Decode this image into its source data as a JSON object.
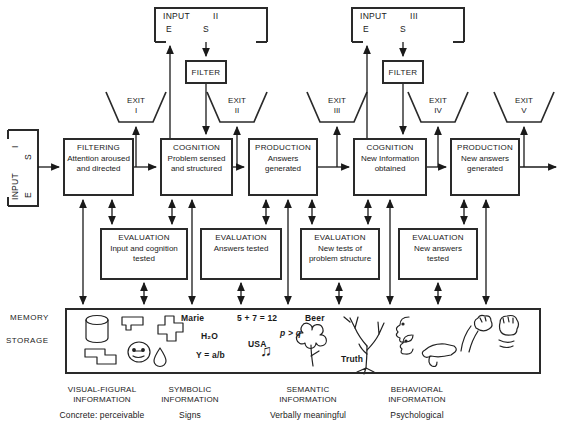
{
  "inputs": {
    "side": {
      "label": "INPUT",
      "numeral": "I",
      "letter_s": "S",
      "letter_e": "E"
    },
    "top_left": {
      "label": "INPUT",
      "numeral": "II",
      "letter_e": "E",
      "letter_s": "S"
    },
    "top_right": {
      "label": "INPUT",
      "numeral": "III",
      "letter_e": "E",
      "letter_s": "S"
    }
  },
  "filters": {
    "left": "FILTER",
    "right": "FILTER"
  },
  "exits": [
    {
      "label": "EXIT",
      "numeral": "I"
    },
    {
      "label": "EXIT",
      "numeral": "II"
    },
    {
      "label": "EXIT",
      "numeral": "III"
    },
    {
      "label": "EXIT",
      "numeral": "IV"
    },
    {
      "label": "EXIT",
      "numeral": "V"
    }
  ],
  "main_boxes": [
    {
      "title": "FILTERING",
      "body": "Attention aroused and directed"
    },
    {
      "title": "COGNITION",
      "body": "Problem sensed and structured"
    },
    {
      "title": "PRODUCTION",
      "body": "Answers generated"
    },
    {
      "title": "COGNITION",
      "body": "New Information obtained"
    },
    {
      "title": "PRODUCTION",
      "body": "New answers generated"
    }
  ],
  "evaluation_boxes": [
    {
      "title": "EVALUATION",
      "body": "Input and cognition tested"
    },
    {
      "title": "EVALUATION",
      "body": "Answers tested"
    },
    {
      "title": "EVALUATION",
      "body": "New tests of problem structure"
    },
    {
      "title": "EVALUATION",
      "body": "New answers tested"
    }
  ],
  "memory": {
    "label_top": "MEMORY",
    "label_bottom": "STORAGE",
    "symbolic_items": {
      "name": "Marie",
      "formula": "H₂O",
      "equation": "Y = a/b"
    },
    "semantic_items": {
      "sum": "5 + 7 = 12",
      "word_beer": "Beer",
      "logic": "p > q",
      "word_usa": "USA",
      "word_truth": "Truth"
    },
    "icons": {
      "music_notes": "♫"
    }
  },
  "categories": [
    {
      "title": "VISUAL-FIGURAL INFORMATION",
      "subtitle": "Concrete: perceivable"
    },
    {
      "title": "SYMBOLIC INFORMATION",
      "subtitle": "Signs"
    },
    {
      "title": "SEMANTIC INFORMATION",
      "subtitle": "Verbally meaningful"
    },
    {
      "title": "BEHAVIORAL INFORMATION",
      "subtitle": "Psychological"
    }
  ]
}
